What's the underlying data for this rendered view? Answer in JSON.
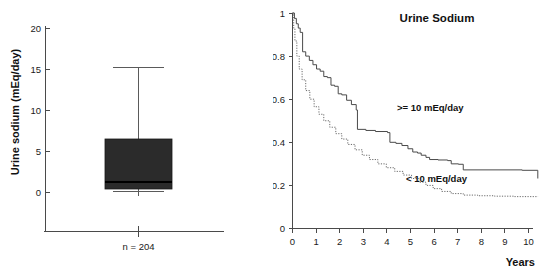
{
  "figure": {
    "panels": [
      "boxplot",
      "kaplan-meier"
    ]
  },
  "chart_data": [
    {
      "type": "box",
      "title": "",
      "xlabel": "",
      "ylabel": "Urine sodium (mEq/day)",
      "ylim": [
        0,
        20
      ],
      "yticks": [
        0,
        5,
        10,
        15,
        20
      ],
      "ytick_labels": [
        "0",
        "5",
        "10",
        "15",
        "20"
      ],
      "grid": false,
      "categories": [
        "n = 204"
      ],
      "group_label": "n = 204",
      "sample_size": 204,
      "boxes": [
        {
          "label": "n = 204",
          "whisker_low": 0.2,
          "q1": 0.5,
          "median": 1.3,
          "q3": 6.5,
          "whisker_high": 15.2,
          "fill_color": "#2b2b2b"
        }
      ]
    },
    {
      "type": "line",
      "title": "Urine Sodium",
      "xlabel": "Years",
      "ylabel": "Survival",
      "xlim": [
        0,
        10
      ],
      "ylim": [
        0,
        1
      ],
      "xticks": [
        0,
        1,
        2,
        3,
        4,
        5,
        6,
        7,
        8,
        9,
        10
      ],
      "xtick_labels": [
        "0",
        "1",
        "2",
        "3",
        "4",
        "5",
        "6",
        "7",
        "8",
        "9",
        "10"
      ],
      "yticks": [
        0,
        0.2,
        0.4,
        0.6,
        0.8,
        1
      ],
      "ytick_labels": [
        "0",
        "0.2",
        "0.4",
        "0.6",
        "0.8",
        "1"
      ],
      "grid": false,
      "legend_position": "inline-annotations",
      "annotations": [
        {
          "text": ">= 10 mEq/day",
          "x": 4.45,
          "y": 0.5
        },
        {
          "text": "< 10 mEq/day",
          "x": 4.7,
          "y": 0.245
        }
      ],
      "series": [
        {
          "name": ">= 10 mEq/day",
          "style": "solid",
          "color": "#4a4a4a",
          "x": [
            0.0,
            0.08,
            0.16,
            0.24,
            0.32,
            0.42,
            0.55,
            0.7,
            0.85,
            1.0,
            1.15,
            1.3,
            1.45,
            1.6,
            1.75,
            1.9,
            2.05,
            2.25,
            2.45,
            2.65,
            2.7,
            3.05,
            3.45,
            3.95,
            4.05,
            4.3,
            4.55,
            4.8,
            5.0,
            5.2,
            5.35,
            5.55,
            5.7,
            6.05,
            6.45,
            6.6,
            6.9,
            7.1,
            9.55,
            10.2
          ],
          "y": [
            1.0,
            0.975,
            0.95,
            0.93,
            0.91,
            0.82,
            0.8,
            0.78,
            0.76,
            0.74,
            0.73,
            0.705,
            0.7,
            0.665,
            0.66,
            0.625,
            0.62,
            0.595,
            0.575,
            0.55,
            0.46,
            0.455,
            0.45,
            0.445,
            0.4,
            0.395,
            0.385,
            0.37,
            0.355,
            0.35,
            0.34,
            0.33,
            0.32,
            0.318,
            0.315,
            0.3,
            0.298,
            0.272,
            0.27,
            0.232
          ]
        },
        {
          "name": "< 10 mEq/day",
          "style": "dotted",
          "color": "#6a6a6a",
          "x": [
            0.0,
            0.05,
            0.1,
            0.18,
            0.28,
            0.4,
            0.55,
            0.72,
            0.9,
            1.1,
            1.3,
            1.55,
            1.8,
            2.05,
            2.3,
            2.6,
            2.9,
            3.2,
            3.55,
            3.9,
            4.25,
            4.6,
            4.95,
            5.25,
            5.55,
            5.85,
            6.2,
            6.6,
            7.1,
            7.7,
            8.4,
            9.2,
            10.2
          ],
          "y": [
            1.0,
            0.93,
            0.87,
            0.8,
            0.74,
            0.69,
            0.64,
            0.6,
            0.565,
            0.53,
            0.5,
            0.47,
            0.44,
            0.415,
            0.39,
            0.365,
            0.34,
            0.32,
            0.3,
            0.282,
            0.265,
            0.248,
            0.232,
            0.215,
            0.2,
            0.185,
            0.172,
            0.162,
            0.155,
            0.152,
            0.15,
            0.148,
            0.147
          ]
        }
      ]
    }
  ]
}
